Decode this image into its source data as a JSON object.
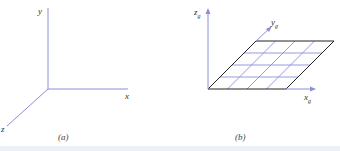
{
  "panel_a": {
    "caption": "(a)",
    "axes": {
      "x": "x",
      "y": "y",
      "z": "z"
    }
  },
  "panel_b": {
    "caption": "(b)",
    "axes": {
      "x": "x",
      "x_sub": "g",
      "y": "y",
      "y_sub": "g",
      "z": "z",
      "z_sub": "g"
    },
    "grid": {
      "rows": 4,
      "cols": 4
    }
  },
  "colors": {
    "axis": "#8a8fd6",
    "grid_line": "#8a90d8",
    "grid_border": "#222222",
    "text": "#333333"
  }
}
